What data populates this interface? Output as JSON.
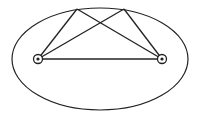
{
  "diagram": {
    "type": "ellipse-foci-reflection",
    "stroke_color": "#222222",
    "background": "#ffffff",
    "ellipse": {
      "cx": 100,
      "cy": 59,
      "rx": 88,
      "ry": 51
    },
    "foci": [
      {
        "id": "focus-left",
        "x": 38,
        "y": 59
      },
      {
        "id": "focus-right",
        "x": 162,
        "y": 59
      }
    ],
    "boundary_points": [
      {
        "id": "point-top-left",
        "x": 77,
        "y": 9
      },
      {
        "id": "point-top-right",
        "x": 124,
        "y": 9
      }
    ],
    "segments": [
      {
        "from": "focus-left",
        "to": "focus-right"
      },
      {
        "from": "focus-left",
        "to": "point-top-left"
      },
      {
        "from": "point-top-left",
        "to": "focus-right"
      },
      {
        "from": "focus-left",
        "to": "point-top-right"
      },
      {
        "from": "point-top-right",
        "to": "focus-right"
      }
    ]
  }
}
